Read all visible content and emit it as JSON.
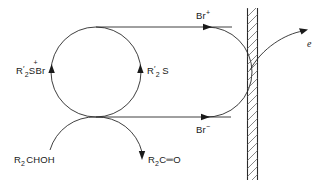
{
  "diagram": {
    "background_color": "#ffffff",
    "stroke_color": "#2a2a2a",
    "labels": {
      "mediator_reduced": {
        "base_1": "R",
        "prime": "′",
        "sub_1": "2",
        "center": "S",
        "charge": "+",
        "tail": "Br",
        "plain": "R'2S+Br"
      },
      "mediator_oxidized": {
        "base_1": "R",
        "prime": "′",
        "sub_1": "2",
        "center": "S",
        "plain": "R'2S"
      },
      "bromine_cation": {
        "base": "Br",
        "charge": "+",
        "plain": "Br+"
      },
      "bromide_anion": {
        "base": "Br",
        "charge": "−",
        "plain": "Br-"
      },
      "alcohol": {
        "base_1": "R",
        "sub_1": "2",
        "tail": "CHOH",
        "plain": "R2CHOH"
      },
      "ketone": {
        "base_1": "R",
        "sub_1": "2",
        "mid": "C",
        "bond": "═",
        "tail": "O",
        "plain": "R2C=O"
      },
      "electron": {
        "symbol": "e",
        "plain": "e"
      }
    },
    "electrode": {
      "name": "anode",
      "hatched": true,
      "x": 247,
      "width": 11,
      "hatch_color": "#555555"
    }
  }
}
